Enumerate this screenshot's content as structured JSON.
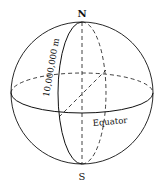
{
  "diagram": {
    "labels": {
      "north": "N",
      "south": "S",
      "equator": "Equator",
      "distance": "10,000,000 m"
    },
    "colors": {
      "stroke": "#111111",
      "background": "#ffffff"
    }
  }
}
